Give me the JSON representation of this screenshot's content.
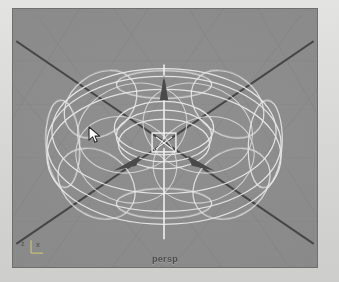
{
  "app": {
    "kind": "3d-modeling-viewport",
    "panel_label": "persp"
  },
  "viewport": {
    "label": "persp",
    "background_color": "#8a8a8a",
    "border_color": "#6f6f6f",
    "grid_line_color": "#7e7e7e",
    "axis_line_color": "#4a4a4a",
    "wireframe_color": "#e8e8e8",
    "manipulator_color": "#f2f2f2",
    "arrow_color": "#4d4d4d"
  },
  "axis_gizmo": {
    "z_label": "z",
    "x_label": "x",
    "color": "#5d5d5d"
  },
  "outer": {
    "background_color": "#d9d9d7"
  },
  "cursor": {
    "name": "arrow-pointer",
    "x": 92,
    "y": 133,
    "fill": "#ffffff",
    "stroke": "#2a2a2a"
  },
  "scene": {
    "object_name": "torus-wireframe",
    "selected": true,
    "manipulator": "move-tool",
    "handles": [
      {
        "name": "y-axis-handle",
        "direction": "up"
      },
      {
        "name": "x-axis-handle",
        "direction": "left-diagonal"
      },
      {
        "name": "z-axis-handle",
        "direction": "right-diagonal"
      },
      {
        "name": "center-handle",
        "direction": "screen-space"
      }
    ]
  }
}
